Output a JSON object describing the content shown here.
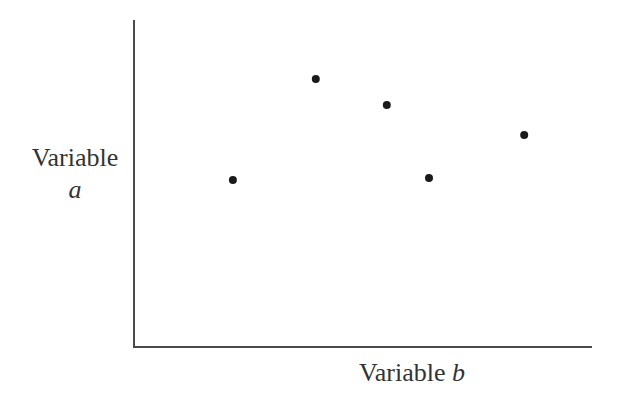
{
  "chart_data": {
    "type": "scatter",
    "title": "",
    "xlabel": "Variable b",
    "ylabel": "Variable a",
    "xlabel_parts": {
      "word": "Variable",
      "var": "b"
    },
    "ylabel_parts": {
      "word": "Variable",
      "var": "a"
    },
    "ticks": "none",
    "grid": false,
    "legend": "none",
    "xlim": [
      0,
      100
    ],
    "ylim": [
      0,
      100
    ],
    "points": [
      {
        "x": 21.6,
        "y": 51.1
      },
      {
        "x": 39.7,
        "y": 82.0
      },
      {
        "x": 55.2,
        "y": 74.0
      },
      {
        "x": 64.4,
        "y": 51.7
      },
      {
        "x": 85.2,
        "y": 64.8
      }
    ],
    "marker_color": "#1a1a1a",
    "axis_color": "#4a4a4a"
  }
}
